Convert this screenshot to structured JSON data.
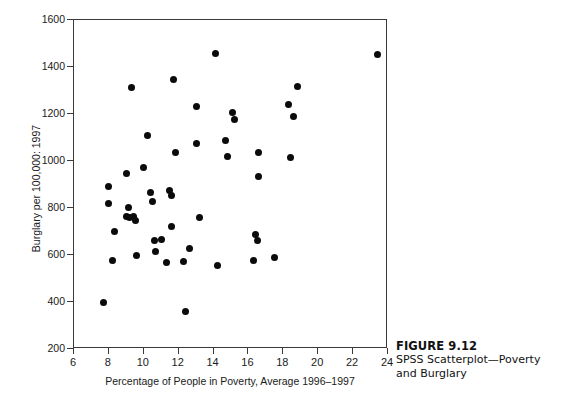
{
  "figure": {
    "caption_title": "FIGURE 9.12",
    "caption_text": "SPSS Scatterplot—Poverty and Burglary"
  },
  "chart_data": {
    "type": "scatter",
    "title": "",
    "xlabel": "Percentage of People in Poverty, Average 1996–1997",
    "ylabel": "Burglary per 100,000: 1997",
    "xlim": [
      6,
      24
    ],
    "ylim": [
      200,
      1600
    ],
    "xticks": [
      6,
      8,
      10,
      12,
      14,
      16,
      18,
      20,
      22,
      24
    ],
    "yticks": [
      200,
      400,
      600,
      800,
      1000,
      1200,
      1400,
      1600
    ],
    "xtick_labels": [
      "6",
      "8",
      "10",
      "12",
      "14",
      "16",
      "18",
      "20",
      "22",
      "24"
    ],
    "ytick_labels": [
      "200",
      "400",
      "600",
      "800",
      "1000",
      "1200",
      "1400",
      "1600"
    ],
    "grid": false,
    "legend": null,
    "marker": {
      "shape": "circle",
      "color": "#0b0b0b",
      "size": 7
    },
    "points": [
      {
        "x": 7.7,
        "y": 400
      },
      {
        "x": 8.0,
        "y": 893
      },
      {
        "x": 8.0,
        "y": 820
      },
      {
        "x": 8.3,
        "y": 702
      },
      {
        "x": 8.2,
        "y": 575
      },
      {
        "x": 9.0,
        "y": 947
      },
      {
        "x": 9.1,
        "y": 802
      },
      {
        "x": 9.0,
        "y": 765
      },
      {
        "x": 9.2,
        "y": 758
      },
      {
        "x": 9.4,
        "y": 762
      },
      {
        "x": 9.5,
        "y": 745
      },
      {
        "x": 9.3,
        "y": 1311
      },
      {
        "x": 9.6,
        "y": 598
      },
      {
        "x": 10.0,
        "y": 973
      },
      {
        "x": 10.2,
        "y": 1110
      },
      {
        "x": 10.4,
        "y": 866
      },
      {
        "x": 10.5,
        "y": 828
      },
      {
        "x": 10.6,
        "y": 663
      },
      {
        "x": 10.7,
        "y": 614
      },
      {
        "x": 11.0,
        "y": 664
      },
      {
        "x": 11.3,
        "y": 568
      },
      {
        "x": 11.5,
        "y": 874
      },
      {
        "x": 11.6,
        "y": 853
      },
      {
        "x": 11.7,
        "y": 1345
      },
      {
        "x": 11.8,
        "y": 1037
      },
      {
        "x": 11.6,
        "y": 722
      },
      {
        "x": 12.3,
        "y": 573
      },
      {
        "x": 12.4,
        "y": 360
      },
      {
        "x": 12.6,
        "y": 627
      },
      {
        "x": 13.0,
        "y": 1232
      },
      {
        "x": 13.0,
        "y": 1073
      },
      {
        "x": 13.2,
        "y": 758
      },
      {
        "x": 14.1,
        "y": 1457
      },
      {
        "x": 14.2,
        "y": 557
      },
      {
        "x": 14.7,
        "y": 1088
      },
      {
        "x": 14.8,
        "y": 1018
      },
      {
        "x": 15.1,
        "y": 1205
      },
      {
        "x": 15.2,
        "y": 1178
      },
      {
        "x": 16.3,
        "y": 578
      },
      {
        "x": 16.4,
        "y": 687
      },
      {
        "x": 16.5,
        "y": 660
      },
      {
        "x": 16.6,
        "y": 1038
      },
      {
        "x": 16.6,
        "y": 932
      },
      {
        "x": 17.5,
        "y": 590
      },
      {
        "x": 18.3,
        "y": 1240
      },
      {
        "x": 18.4,
        "y": 1015
      },
      {
        "x": 18.6,
        "y": 1190
      },
      {
        "x": 18.8,
        "y": 1318
      },
      {
        "x": 23.4,
        "y": 1452
      }
    ]
  }
}
